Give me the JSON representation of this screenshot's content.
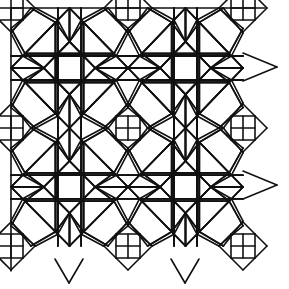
{
  "figure": {
    "title": "Geometric star-and-square lattice tiling",
    "stroke_color": "#111111",
    "background": "#ffffff",
    "xs": [
      11,
      128,
      243
    ],
    "ys": [
      8,
      128,
      246
    ],
    "star_centers": [
      [
        69,
        67
      ],
      [
        185,
        67
      ],
      [
        69,
        185
      ],
      [
        185,
        185
      ]
    ],
    "cell_segments": [
      [
        [
          0.17,
          0
        ],
        [
          0,
          0.21
        ]
      ],
      [
        [
          0.17,
          0
        ],
        [
          0.38,
          0.12
        ]
      ],
      [
        [
          0.38,
          0.12
        ],
        [
          0.5,
          0.28
        ]
      ],
      [
        [
          0.5,
          0.28
        ],
        [
          0.62,
          0.12
        ]
      ],
      [
        [
          0.62,
          0.12
        ],
        [
          0.83,
          0
        ]
      ],
      [
        [
          0.38,
          0.12
        ],
        [
          0.1,
          0.4
        ]
      ],
      [
        [
          0.62,
          0.12
        ],
        [
          0.9,
          0.4
        ]
      ],
      [
        [
          0,
          0.21
        ],
        [
          0.1,
          0.4
        ]
      ],
      [
        [
          0.1,
          0.4
        ],
        [
          0,
          0.5
        ]
      ],
      [
        [
          0.1,
          0.4
        ],
        [
          0.28,
          0.5
        ]
      ],
      [
        [
          0.38,
          0.12
        ],
        [
          0.38,
          0.88
        ]
      ],
      [
        [
          0.62,
          0.12
        ],
        [
          0.62,
          0.88
        ]
      ],
      [
        [
          0,
          0.4
        ],
        [
          1,
          0.4
        ]
      ],
      [
        [
          0,
          0.6
        ],
        [
          1,
          0.6
        ]
      ],
      [
        [
          0.5,
          0
        ],
        [
          0.5,
          0.28
        ]
      ],
      [
        [
          0.5,
          0
        ],
        [
          0.38,
          0.12
        ]
      ],
      [
        [
          0.5,
          0
        ],
        [
          0.62,
          0.12
        ]
      ],
      [
        [
          0.28,
          0.5
        ],
        [
          0.5,
          0.28
        ]
      ],
      [
        [
          0.5,
          0.28
        ],
        [
          0.72,
          0.5
        ]
      ],
      [
        [
          0,
          0.5
        ],
        [
          0.28,
          0.5
        ]
      ]
    ],
    "diamond_radius": 24,
    "diamond_grid_half": 12
  }
}
